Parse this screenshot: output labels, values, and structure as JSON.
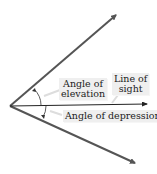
{
  "diagram": {
    "colors": {
      "ray": "#555555",
      "line_of_sight": "#222222",
      "arc": "#333333",
      "label_bg": "#efefef",
      "label_text": "#222222"
    },
    "labels": {
      "elevation_line1": "Angle of",
      "elevation_line2": "elevation",
      "sight_line1": "Line of",
      "sight_line2": "sight",
      "depression": "Angle of depression"
    },
    "geometry": {
      "vertex": [
        10,
        106
      ],
      "upper_ray_end": [
        117,
        14
      ],
      "lower_ray_end": [
        136,
        164
      ],
      "line_of_sight_end": [
        148,
        104
      ]
    }
  }
}
